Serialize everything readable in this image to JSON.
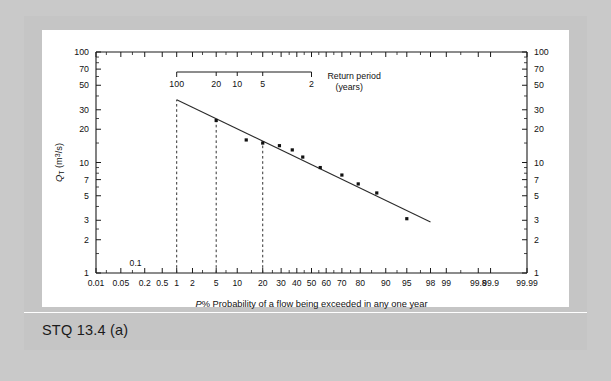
{
  "figure": {
    "caption": "STQ 13.4 (a)",
    "annotation_label": "0.1"
  },
  "axes": {
    "y_title_main": "Q",
    "y_title_sub": "T",
    "y_title_unit": " (m",
    "y_title_exp": "3",
    "y_title_tail": "/s)",
    "x_title_italic": "P",
    "x_title_pct": "%",
    "x_title_rest": "Probability of a flow being exceeded in any one year",
    "return_period_line1": "Return period",
    "return_period_line2": "(years)"
  },
  "chart_data": {
    "type": "scatter",
    "title": "STQ 13.4 (a)",
    "xlabel": "P%  Probability of a flow being exceeded in any one year",
    "ylabel": "Q_T (m3/s)",
    "x_scale": "probability",
    "y_scale": "log",
    "xlim": [
      0.01,
      99.99
    ],
    "ylim": [
      1,
      100
    ],
    "grid": false,
    "legend": null,
    "x_ticks": [
      0.01,
      0.05,
      0.2,
      0.5,
      1,
      2,
      5,
      10,
      20,
      30,
      40,
      50,
      60,
      70,
      80,
      90,
      95,
      98,
      99,
      99.8,
      99.9,
      99.99
    ],
    "x_tick_labels": [
      "0.01",
      "0.05",
      "0.2",
      "0.5",
      "1",
      "2",
      "5",
      "10",
      "20",
      "30",
      "40",
      "50",
      "60",
      "70",
      "80",
      "90",
      "95",
      "98",
      "99",
      "99.8",
      "99.9",
      "99.99"
    ],
    "y_ticks": [
      1,
      2,
      3,
      5,
      7,
      10,
      20,
      30,
      50,
      70,
      100
    ],
    "y_tick_labels": [
      "1",
      "2",
      "3",
      "5",
      "7",
      "10",
      "20",
      "30",
      "50",
      "70",
      "100"
    ],
    "y_ticks_right": [
      1,
      2,
      3,
      5,
      7,
      10,
      20,
      30,
      50,
      70,
      100
    ],
    "y_tick_labels_right": [
      "1",
      "2",
      "3",
      "5",
      "7",
      "10",
      "20",
      "30",
      "50",
      "70",
      "100"
    ],
    "secondary_axis": {
      "name": "Return period (years)",
      "position": "top",
      "ticks": [
        100,
        20,
        10,
        5,
        2
      ],
      "tick_labels": [
        "100",
        "20",
        "10",
        "5",
        "2"
      ],
      "maps_to_probability": [
        1,
        5,
        10,
        20,
        50
      ]
    },
    "reference_lines": [
      {
        "x": 1,
        "style": "dashed",
        "return_period": 100
      },
      {
        "x": 5,
        "style": "dashed",
        "return_period": 20
      },
      {
        "x": 20,
        "style": "dashed",
        "return_period": 5
      }
    ],
    "points": [
      {
        "x": 5.0,
        "y": 24.0
      },
      {
        "x": 13.0,
        "y": 16.0
      },
      {
        "x": 20.0,
        "y": 15.0
      },
      {
        "x": 29.0,
        "y": 14.2
      },
      {
        "x": 37.0,
        "y": 13.0
      },
      {
        "x": 44.0,
        "y": 11.2
      },
      {
        "x": 56.0,
        "y": 9.0
      },
      {
        "x": 70.0,
        "y": 7.7
      },
      {
        "x": 79.0,
        "y": 6.4
      },
      {
        "x": 87.0,
        "y": 5.3
      },
      {
        "x": 95.0,
        "y": 3.1
      }
    ],
    "fit_line": {
      "type": "straight",
      "from": {
        "x": 1.0,
        "y": 37.0
      },
      "to": {
        "x": 98.0,
        "y": 2.9
      }
    }
  }
}
